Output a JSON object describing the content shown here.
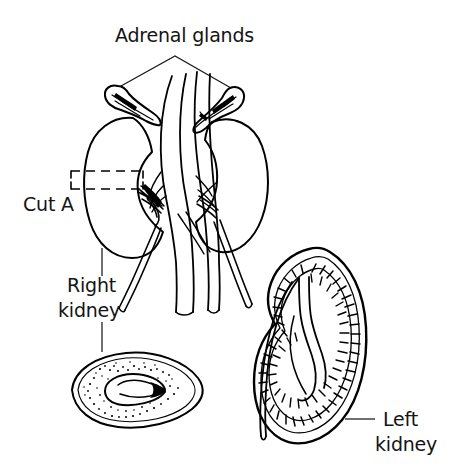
{
  "figure": {
    "background_color": "#ffffff",
    "ink_color": "#000000",
    "text_color": "#141414",
    "style": "black-and-white line drawing",
    "width": 463,
    "height": 472
  },
  "labels": {
    "adrenal_glands": "Adrenal glands",
    "cut_a": "Cut A",
    "right_kidney_line1": "Right",
    "right_kidney_line2": "kidney",
    "left_kidney_line1": "Left",
    "left_kidney_line2": "kidney"
  },
  "parts": [
    {
      "name": "adrenal-gland-right",
      "label": "Adrenal glands",
      "description": "cap-shaped gland atop the right kidney"
    },
    {
      "name": "adrenal-gland-left",
      "label": "Adrenal glands",
      "description": "cap-shaped gland atop the left kidney"
    },
    {
      "name": "right-kidney",
      "label": "Right kidney",
      "description": "bean-shaped kidney, viewer left"
    },
    {
      "name": "left-kidney-whole",
      "label": "Left kidney",
      "description": "bean-shaped kidney, viewer right of main drawing"
    },
    {
      "name": "left-kidney-section",
      "label": "Left kidney",
      "description": "sectioned kidney showing cortex, hatched medullary pyramids, renal pelvis and ureter"
    },
    {
      "name": "cross-section-cut-a",
      "label": "Cut A",
      "description": "transverse cross-section of the right kidney with stippled cortex and dark renal pelvis"
    },
    {
      "name": "inferior-vena-cava",
      "label": "",
      "description": "large central vessel"
    },
    {
      "name": "abdominal-aorta",
      "label": "",
      "description": "large central vessel beside the vena cava"
    },
    {
      "name": "ureters",
      "label": "",
      "description": "tubes descending from each kidney hilum"
    }
  ],
  "annotations": {
    "adrenal_leader": "inverted-V leader from label to both adrenal glands",
    "cut_a_marker": "dashed rectangle across the right kidney indicating the plane of section",
    "right_kidney_leader": "vertical leader line from right kidney down to cross-section",
    "left_kidney_leader": "short horizontal dash from label to sectioned kidney"
  }
}
